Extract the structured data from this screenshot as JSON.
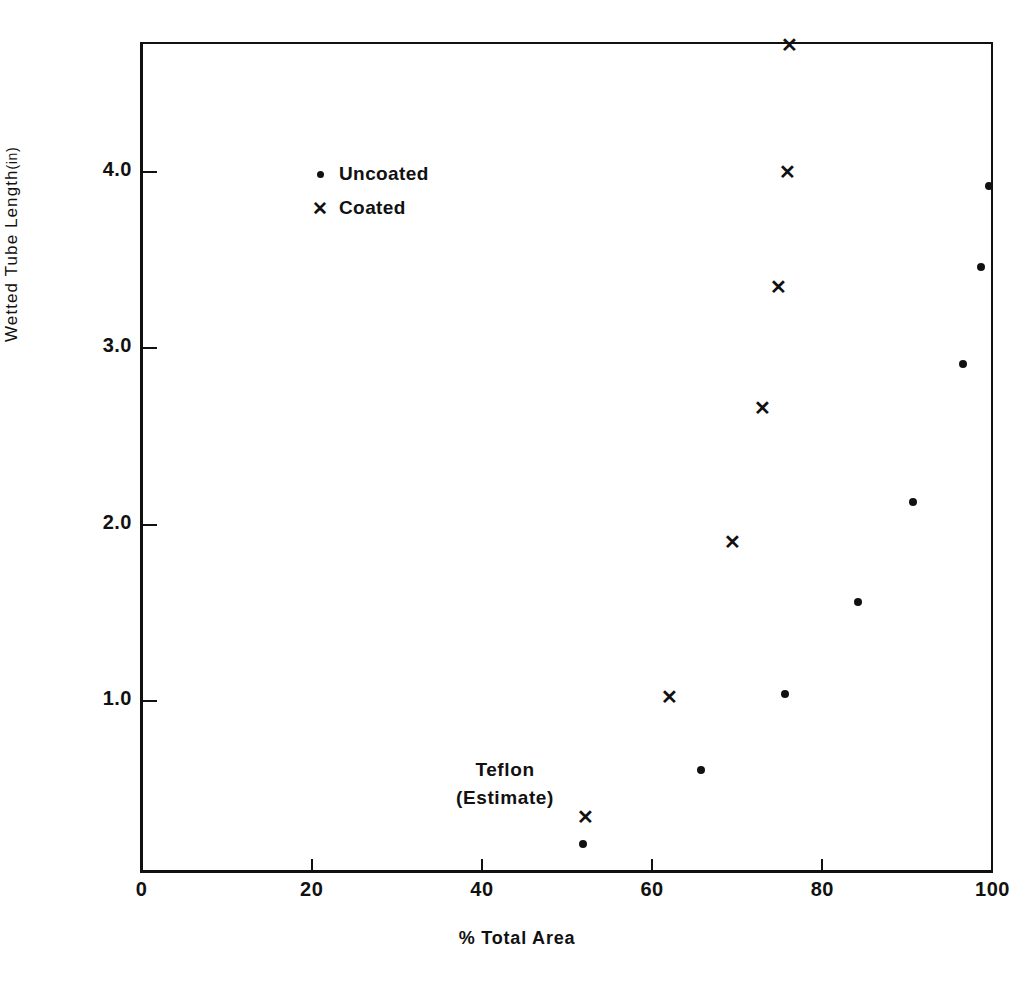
{
  "chart_data": {
    "type": "scatter",
    "title": "",
    "xlabel": "% Total Area",
    "ylabel": "Wetted Tube Length (in)",
    "xlim": [
      0,
      100
    ],
    "ylim": [
      0,
      4.72
    ],
    "grid": false,
    "legend_position": "upper-left-inside",
    "xticks": [
      {
        "value": 0,
        "label": "0"
      },
      {
        "value": 20,
        "label": "20"
      },
      {
        "value": 40,
        "label": "40"
      },
      {
        "value": 60,
        "label": "60"
      },
      {
        "value": 80,
        "label": "80"
      },
      {
        "value": 100,
        "label": "100"
      }
    ],
    "yticks": [
      {
        "value": 1.0,
        "label": "1.0"
      },
      {
        "value": 2.0,
        "label": "2.0"
      },
      {
        "value": 3.0,
        "label": "3.0"
      },
      {
        "value": 4.0,
        "label": "4.0"
      }
    ],
    "series": [
      {
        "name": "Uncoated",
        "marker": "dot",
        "color": "#111111",
        "points": [
          {
            "x": 51.9,
            "y": 0.19
          },
          {
            "x": 65.7,
            "y": 0.61
          },
          {
            "x": 75.6,
            "y": 1.04
          },
          {
            "x": 84.2,
            "y": 1.56
          },
          {
            "x": 90.6,
            "y": 2.13
          },
          {
            "x": 96.5,
            "y": 2.91
          },
          {
            "x": 98.6,
            "y": 3.46
          },
          {
            "x": 99.6,
            "y": 3.92
          }
        ]
      },
      {
        "name": "Coated",
        "marker": "x",
        "color": "#111111",
        "points": [
          {
            "x": 52.2,
            "y": 0.34
          },
          {
            "x": 62.1,
            "y": 1.02
          },
          {
            "x": 69.4,
            "y": 1.9
          },
          {
            "x": 73.0,
            "y": 2.66
          },
          {
            "x": 74.8,
            "y": 3.35
          },
          {
            "x": 75.9,
            "y": 4.0
          },
          {
            "x": 76.1,
            "y": 4.72
          }
        ]
      }
    ],
    "annotations": [
      {
        "text_line1": "Teflon",
        "text_line2": "(Estimate)",
        "x": 54,
        "y": 0.62
      }
    ]
  },
  "legend": {
    "items": [
      {
        "key": "•",
        "label": "Uncoated"
      },
      {
        "key": "✕",
        "label": "Coated"
      }
    ]
  },
  "axes": {
    "y_title_main": "Wetted Tube Length",
    "y_title_unit": "(in)",
    "x_title": "% Total Area"
  },
  "annotation": {
    "line1": "Teflon",
    "line2": "(Estimate)"
  },
  "colors": {
    "ink": "#111111",
    "background": "#ffffff"
  }
}
